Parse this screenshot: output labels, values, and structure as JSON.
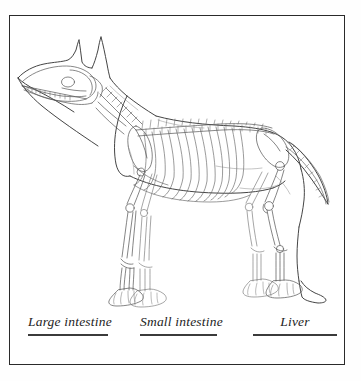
{
  "worksheet": {
    "title": "Dog anatomy identification worksheet",
    "frame_color": "#2a2a2a",
    "background_color": "#ffffff",
    "ink_color": "#3b3b3b"
  },
  "illustration": {
    "name": "dog-skeleton-line-drawing",
    "subject": "dog",
    "view": "lateral left side profile",
    "style": "black and white line art with skeletal overlay",
    "description": "Outline drawing of a standing short-haired dog with pointed erect ears, shown in left lateral view with the full skeleton drawn inside the body outline",
    "visible_structures": [
      "skull",
      "mandible with teeth",
      "erect pointed ears",
      "cervical vertebrae",
      "thoracic vertebrae",
      "lumbar vertebrae",
      "caudal vertebrae of tail",
      "ribcage",
      "sternum",
      "scapula",
      "humerus",
      "radius and ulna",
      "carpus and metacarpals",
      "forepaw phalanges",
      "pelvis",
      "femur",
      "patella",
      "tibia and fibula",
      "tarsus and metatarsals",
      "hindpaw phalanges"
    ],
    "abdomen_state": "empty, organs not drawn"
  },
  "answers": {
    "items": [
      {
        "label": "Large intestine",
        "name": "answer-large-intestine",
        "value": ""
      },
      {
        "label": "Small intestine",
        "name": "answer-small-intestine",
        "value": ""
      },
      {
        "label": "Liver",
        "name": "answer-liver",
        "value": ""
      }
    ]
  }
}
